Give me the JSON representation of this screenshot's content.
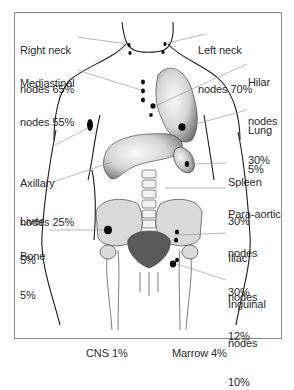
{
  "diagram": {
    "colors": {
      "outline": "#1a1a1a",
      "node_dot": "#0a0a0a",
      "leader_line": "#9a9a9a",
      "organ_shade_dark": "#6e6e6e",
      "organ_shade_light": "#f4f4f4",
      "bone_fill": "#d9d9d9",
      "pelvis_dark": "#5a5a5a",
      "frame_border": "#8a8a8a",
      "text": "#2a2a2a"
    }
  },
  "labels": {
    "right_neck": {
      "line1": "Right neck",
      "line2": "nodes 65%"
    },
    "left_neck": {
      "line1": "Left neck",
      "line2": "nodes 70%"
    },
    "mediastinal": {
      "line1": "Mediastinal",
      "line2": "nodes 55%"
    },
    "hilar": {
      "line1": "Hilar",
      "line2": "nodes",
      "line3": "30%"
    },
    "lung": {
      "line1": "Lung",
      "line2": "5%"
    },
    "axillary": {
      "line1": "Axillary",
      "line2": "nodes 25%"
    },
    "spleen": {
      "line1": "Spleen",
      "line2": "30%"
    },
    "liver": {
      "line1": "Liver",
      "line2": "5%"
    },
    "para_aortic": {
      "line1": "Para-aortic",
      "line2": "nodes",
      "line3": "30%"
    },
    "bone": {
      "line1": "Bone",
      "line2": "5%"
    },
    "iliac": {
      "line1": "Iliac",
      "line2": "nodes",
      "line3": "12%"
    },
    "inguinal": {
      "line1": "Inguinal",
      "line2": "nodes",
      "line3": "10%"
    },
    "cns": {
      "text": "CNS 1%"
    },
    "marrow": {
      "text": "Marrow 4%"
    }
  }
}
